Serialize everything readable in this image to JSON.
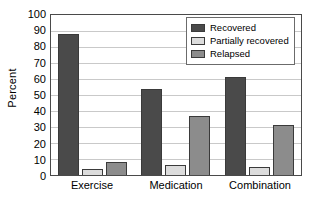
{
  "chart_data": {
    "type": "bar",
    "title": "",
    "xlabel": "",
    "ylabel": "Percent",
    "ylim": [
      0,
      100
    ],
    "ytick_step": 10,
    "yticks": [
      100,
      90,
      80,
      70,
      60,
      50,
      40,
      30,
      20,
      10,
      0
    ],
    "ytick_labels": [
      "100",
      "90",
      "80",
      "70",
      "60",
      "50",
      "40",
      "30",
      "20",
      "10",
      "0"
    ],
    "grid": "horizontal",
    "legend_position": "top-right",
    "categories": [
      "Exercise",
      "Medication",
      "Combination"
    ],
    "series": [
      {
        "name": "Recovered",
        "color": "#4a4a4a",
        "values": [
          88,
          54,
          61
        ]
      },
      {
        "name": "Partially recovered",
        "color": "#dcdcdc",
        "values": [
          4,
          6,
          5
        ]
      },
      {
        "name": "Relapsed",
        "color": "#8c8c8c",
        "values": [
          8,
          37,
          31
        ]
      }
    ]
  },
  "legend": {
    "items": [
      {
        "label": "Recovered"
      },
      {
        "label": "Partially recovered"
      },
      {
        "label": "Relapsed"
      }
    ]
  },
  "colors": {
    "recovered": "#4a4a4a",
    "partially_recovered": "#dcdcdc",
    "relapsed": "#8c8c8c",
    "axis": "#4a4a4a",
    "gridline": "#c9c9c9",
    "background": "#ffffff"
  }
}
